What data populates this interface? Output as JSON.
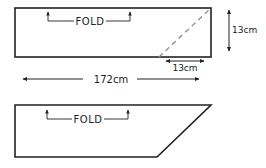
{
  "diagram": {
    "colors": {
      "stroke": "#222222",
      "dashed": "#8a8a8a",
      "background": "#ffffff"
    },
    "top_panel": {
      "fold_label": "FOLD",
      "height_label": "13cm",
      "cut_width_label": "13cm",
      "length_label": "172cm"
    },
    "bottom_panel": {
      "fold_label": "FOLD"
    }
  }
}
